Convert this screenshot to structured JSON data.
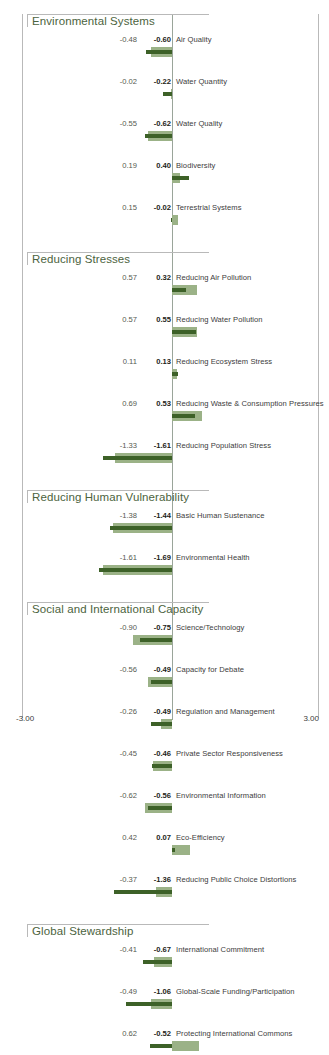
{
  "chart_data": {
    "type": "bar",
    "orientation": "horizontal",
    "title": "",
    "xlabel": "",
    "ylabel": "",
    "xlim": [
      -3.0,
      3.0
    ],
    "grid": false,
    "legend": "none",
    "axis": {
      "min_label": "-3.00",
      "max_label": "3.00",
      "zero_line": true
    },
    "series": [
      {
        "name": "value1",
        "color": "#9bb287",
        "style": "light-green thick bar"
      },
      {
        "name": "value2",
        "color": "#3d6128",
        "style": "dark-green thin bar"
      }
    ],
    "sections": [
      {
        "title": "Environmental Systems",
        "rows": [
          {
            "label": "Air Quality",
            "v1": "-0.48",
            "v2": "-0.60",
            "v1n": -0.48,
            "v2n": -0.6
          },
          {
            "label": "Water Quantity",
            "v1": "-0.02",
            "v2": "-0.22",
            "v1n": -0.02,
            "v2n": -0.22
          },
          {
            "label": "Water Quality",
            "v1": "-0.55",
            "v2": "-0.62",
            "v1n": -0.55,
            "v2n": -0.62
          },
          {
            "label": "Biodiversity",
            "v1": "0.19",
            "v2": "0.40",
            "v1n": 0.19,
            "v2n": 0.4
          },
          {
            "label": "Terrestrial Systems",
            "v1": "0.15",
            "v2": "-0.02",
            "v1n": 0.15,
            "v2n": -0.02
          }
        ]
      },
      {
        "title": "Reducing Stresses",
        "rows": [
          {
            "label": "Reducing Air Pollution",
            "v1": "0.57",
            "v2": "0.32",
            "v1n": 0.57,
            "v2n": 0.32
          },
          {
            "label": "Reducing Water Pollution",
            "v1": "0.57",
            "v2": "0.55",
            "v1n": 0.57,
            "v2n": 0.55
          },
          {
            "label": "Reducing Ecosystem Stress",
            "v1": "0.11",
            "v2": "0.13",
            "v1n": 0.11,
            "v2n": 0.13
          },
          {
            "label": "Reducing Waste & Consumption Pressures",
            "v1": "0.69",
            "v2": "0.53",
            "v1n": 0.69,
            "v2n": 0.53
          },
          {
            "label": "Reducing Population Stress",
            "v1": "-1.33",
            "v2": "-1.61",
            "v1n": -1.33,
            "v2n": -1.61
          }
        ]
      },
      {
        "title": "Reducing Human Vulnerability",
        "rows": [
          {
            "label": "Basic Human Sustenance",
            "v1": "-1.38",
            "v2": "-1.44",
            "v1n": -1.38,
            "v2n": -1.44
          },
          {
            "label": "Environmental Health",
            "v1": "-1.61",
            "v2": "-1.69",
            "v1n": -1.61,
            "v2n": -1.69
          }
        ]
      },
      {
        "title": "Social and International Capacity",
        "rows": [
          {
            "label": "Science/Technology",
            "v1": "-0.90",
            "v2": "-0.75",
            "v1n": -0.9,
            "v2n": -0.75
          },
          {
            "label": "Capacity for Debate",
            "v1": "-0.56",
            "v2": "-0.49",
            "v1n": -0.56,
            "v2n": -0.49
          },
          {
            "label": "Regulation and Management",
            "v1": "-0.26",
            "v2": "-0.49",
            "v1n": -0.26,
            "v2n": -0.49
          },
          {
            "label": "Private Sector Responsiveness",
            "v1": "-0.45",
            "v2": "-0.46",
            "v1n": -0.45,
            "v2n": -0.46
          },
          {
            "label": "Environmental Information",
            "v1": "-0.62",
            "v2": "-0.56",
            "v1n": -0.62,
            "v2n": -0.56
          },
          {
            "label": "Eco-Efficiency",
            "v1": "0.42",
            "v2": "0.07",
            "v1n": 0.42,
            "v2n": 0.07
          },
          {
            "label": "Reducing Public Choice Distortions",
            "v1": "-0.37",
            "v2": "-1.36",
            "v1n": -0.37,
            "v2n": -1.36
          }
        ]
      },
      {
        "title": "Global Stewardship",
        "rows": [
          {
            "label": "International Commitment",
            "v1": "-0.41",
            "v2": "-0.67",
            "v1n": -0.41,
            "v2n": -0.67
          },
          {
            "label": "Global-Scale Funding/Participation",
            "v1": "-0.49",
            "v2": "-1.06",
            "v1n": -0.49,
            "v2n": -1.06
          },
          {
            "label": "Protecting International Commons",
            "v1": "0.62",
            "v2": "-0.52",
            "v1n": 0.62,
            "v2n": -0.52
          }
        ]
      }
    ]
  }
}
